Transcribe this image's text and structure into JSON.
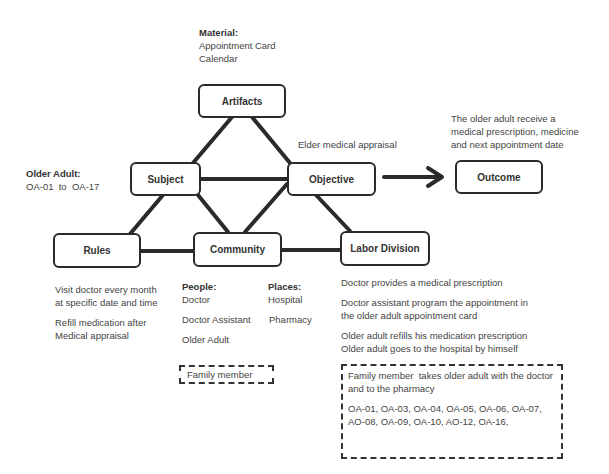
{
  "nodes": {
    "artifacts": "Artifacts",
    "subject": "Subject",
    "objective": "Objective",
    "outcome": "Outcome",
    "rules": "Rules",
    "community": "Community",
    "labor_division": "Labor Division"
  },
  "artifacts_note": {
    "label": "Material:",
    "items": [
      "Appointment Card",
      "Calendar"
    ]
  },
  "subject_note": {
    "label": "Older Adult:",
    "value": "OA-01  to  OA-17"
  },
  "objective_note": "Elder medical appraisal",
  "outcome_note": [
    "The older adult receive a",
    "medical prescription, medicine",
    "and next appointment date"
  ],
  "rules_note": {
    "rule1": [
      "Visit doctor every month",
      "at specific date and time"
    ],
    "rule2": [
      "Refill medication after",
      "Medical appraisal"
    ]
  },
  "community_note": {
    "people_label": "People:",
    "people": [
      "Doctor",
      "Doctor Assistant",
      "Older Adult"
    ],
    "places_label": "Places:",
    "places": [
      "Hospital",
      "Pharmacy"
    ],
    "optional": "Family member"
  },
  "labor_note": {
    "items": [
      [
        "Doctor provides a medical prescription"
      ],
      [
        "Doctor assistant program the appointment in",
        "the older adult appointment card"
      ],
      [
        "Older adult refills his medication prescription",
        "Older adult goes to the hospital by himself"
      ]
    ],
    "optional": {
      "text": [
        "Family member  takes older adult with the doctor",
        "and to the pharmacy"
      ],
      "ids": [
        "OA-01, OA-03, OA-04, OA-05, OA-06, OA-07,",
        "AO-08, OA-09, OA-10, AO-12, OA-16,"
      ]
    }
  }
}
